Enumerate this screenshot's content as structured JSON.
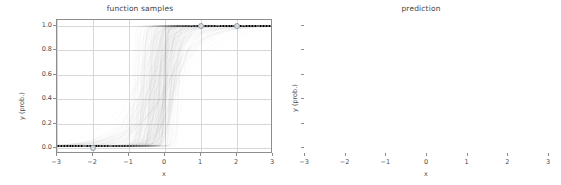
{
  "chart_data": [
    {
      "type": "line",
      "title": "function samples",
      "xlabel": "x",
      "ylabel": "y (prob.)",
      "xlim": [
        -3,
        3
      ],
      "ylim": [
        -0.05,
        1.05
      ],
      "xticks": [
        -3,
        -2,
        -1,
        0,
        1,
        2,
        3
      ],
      "xticklabels": [
        "−3",
        "−2",
        "−1",
        "0",
        "1",
        "2",
        "3"
      ],
      "yticks": [
        0.0,
        0.2,
        0.4,
        0.6,
        0.8,
        1.0
      ],
      "yticklabels": [
        "0.0",
        "0.2",
        "0.4",
        "0.6",
        "0.8",
        "1.0"
      ],
      "grid": true,
      "legend": null,
      "description": "Many overlapping posterior sigmoid function samples drawn in translucent gray, sweeping from y=0 at left to y=1 at right with transition region concentrated between x=-1.5 and x=0.8",
      "series": [
        {
          "name": "posterior samples",
          "kind": "sigmoid-ensemble",
          "color": "#808080",
          "alpha": 0.04,
          "count": 220,
          "slope_range": [
            1.2,
            60.0
          ],
          "midpoint_range": [
            -0.9,
            0.55
          ]
        },
        {
          "name": "data",
          "kind": "scatter",
          "color": "#9aa0a6",
          "x": [
            -2,
            1,
            2
          ],
          "y": [
            0,
            1,
            1
          ]
        }
      ]
    },
    {
      "type": "line",
      "title": "prediction",
      "xlabel": "x",
      "ylabel": "y (prob.)",
      "xlim": [
        -3,
        3
      ],
      "ylim": [
        -0.05,
        1.05
      ],
      "xticks": [
        -3,
        -2,
        -1,
        0,
        1,
        2,
        3
      ],
      "xticklabels": [
        "−3",
        "−2",
        "−1",
        "0",
        "1",
        "2",
        "3"
      ],
      "yticks": [
        0.0,
        0.2,
        0.4,
        0.6,
        0.8,
        1.0
      ],
      "yticklabels": [
        "",
        "",
        "",
        "",
        "",
        ""
      ],
      "grid": true,
      "legend": {
        "position": "upper left",
        "entries": [
          {
            "label": "prediction",
            "marker": "line",
            "color": "#9aa0a6"
          },
          {
            "label": "data",
            "marker": "circle",
            "color": "#9aa0a6"
          }
        ]
      },
      "series": [
        {
          "name": "prediction",
          "kind": "sigmoid",
          "color": "#9aa0a6",
          "slope": 1.75,
          "midpoint": -0.05,
          "points": [
            {
              "x": -3.0,
              "y": 0.006
            },
            {
              "x": -2.5,
              "y": 0.014
            },
            {
              "x": -2.0,
              "y": 0.033
            },
            {
              "x": -1.5,
              "y": 0.077
            },
            {
              "x": -1.0,
              "y": 0.168
            },
            {
              "x": -0.5,
              "y": 0.327
            },
            {
              "x": 0.0,
              "y": 0.522
            },
            {
              "x": 0.5,
              "y": 0.712
            },
            {
              "x": 1.0,
              "y": 0.85
            },
            {
              "x": 1.5,
              "y": 0.929
            },
            {
              "x": 2.0,
              "y": 0.968
            },
            {
              "x": 2.5,
              "y": 0.986
            },
            {
              "x": 3.0,
              "y": 0.994
            }
          ]
        },
        {
          "name": "data",
          "kind": "scatter",
          "color": "#9aa0a6",
          "x": [
            -2,
            1,
            2
          ],
          "y": [
            0,
            1,
            1
          ]
        }
      ]
    }
  ],
  "panels": {
    "left": {
      "title": "function samples",
      "xlabel": "x",
      "ylabel": "y (prob.)",
      "xticklabels": [
        "−3",
        "−2",
        "−1",
        "0",
        "1",
        "2",
        "3"
      ],
      "yticklabels": [
        "0.0",
        "0.2",
        "0.4",
        "0.6",
        "0.8",
        "1.0"
      ]
    },
    "right": {
      "title": "prediction",
      "xlabel": "x",
      "ylabel": "y (prob.)",
      "xticklabels": [
        "−3",
        "−2",
        "−1",
        "0",
        "1",
        "2",
        "3"
      ],
      "legend": {
        "prediction_label": "prediction",
        "data_label": "data"
      }
    }
  },
  "colors": {
    "samples": "#808080",
    "prediction_line": "#9aa0a6",
    "marker_face": "#d8dcde",
    "marker_edge": "#9aa0a6",
    "grid": "#d7d7d7",
    "axis": "#8d8d8d",
    "text": "#4a4a4a",
    "background": "#ffffff"
  }
}
